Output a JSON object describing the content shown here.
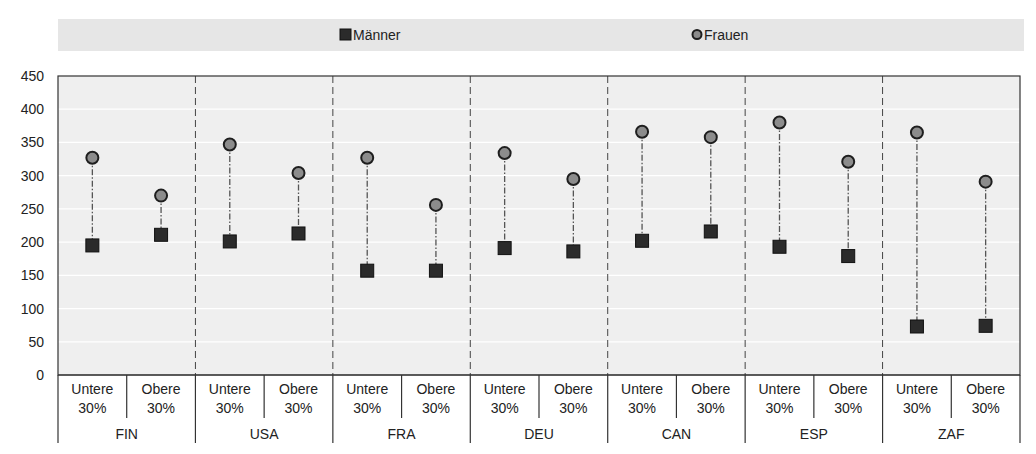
{
  "chart_data": {
    "type": "scatter",
    "title": "",
    "xlabel": "",
    "ylabel": "",
    "ylim": [
      0,
      450
    ],
    "yticks": [
      0,
      50,
      100,
      150,
      200,
      250,
      300,
      350,
      400,
      450
    ],
    "grid": true,
    "legend_position": "top",
    "groups": [
      "FIN",
      "USA",
      "FRA",
      "DEU",
      "CAN",
      "ESP",
      "ZAF"
    ],
    "subcategories": [
      {
        "line1": "Untere",
        "line2": "30%"
      },
      {
        "line1": "Obere",
        "line2": "30%"
      }
    ],
    "series": [
      {
        "name": "Männer",
        "marker": "square",
        "color": "#2b2b2b",
        "values": [
          195,
          211,
          201,
          213,
          157,
          157,
          191,
          186,
          202,
          216,
          193,
          179,
          73,
          74
        ]
      },
      {
        "name": "Frauen",
        "marker": "circle",
        "color": "#8c8c8c",
        "values": [
          327,
          270,
          347,
          304,
          327,
          256,
          334,
          295,
          366,
          358,
          380,
          321,
          365,
          291
        ]
      }
    ]
  }
}
